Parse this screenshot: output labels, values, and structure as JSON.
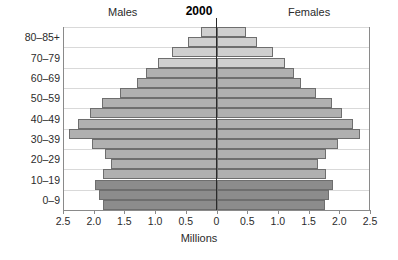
{
  "header": {
    "males_label": "Males",
    "females_label": "Females",
    "year_title": "2000"
  },
  "axis": {
    "x_title": "Millions",
    "x_tick_labels": [
      "2.5",
      "2.0",
      "1.5",
      "1.0",
      "0.5",
      "0",
      "0.5",
      "1.0",
      "1.5",
      "2.0",
      "2.5"
    ],
    "y_tick_labels": [
      "0–9",
      "10–19",
      "20–29",
      "30–39",
      "40–49",
      "50–59",
      "60–69",
      "70–79",
      "80–85+"
    ]
  },
  "colors": {
    "bar_light": "#cfcfcf",
    "bar_medium": "#b0b0b0",
    "bar_dark": "#8c8c8c",
    "bar_border": "#6e6e6e",
    "gridline": "#d9d9d9",
    "axis": "#8a8a8a",
    "center_axis": "#2a2a2a",
    "text": "#2b2b2b",
    "background": "#ffffff"
  },
  "chart_data": {
    "type": "bar",
    "subtype": "population-pyramid",
    "title": "2000",
    "xlabel": "Millions",
    "ylabel": "",
    "xlim": [
      -2.5,
      2.5
    ],
    "grid": true,
    "legend_position": "none",
    "left_series_name": "Males",
    "right_series_name": "Females",
    "categories": [
      "0–4",
      "5–9",
      "10–14",
      "15–19",
      "20–24",
      "25–29",
      "30–34",
      "35–39",
      "40–44",
      "45–49",
      "50–54",
      "55–59",
      "60–64",
      "65–69",
      "70–74",
      "75–79",
      "80–84",
      "85+"
    ],
    "series": [
      {
        "name": "Males",
        "values": [
          1.85,
          1.92,
          1.98,
          1.85,
          1.72,
          1.82,
          2.02,
          2.4,
          2.26,
          2.06,
          1.86,
          1.58,
          1.3,
          1.15,
          0.95,
          0.72,
          0.46,
          0.26
        ]
      },
      {
        "name": "Females",
        "values": [
          1.76,
          1.84,
          1.89,
          1.78,
          1.66,
          1.78,
          1.98,
          2.34,
          2.22,
          2.05,
          1.88,
          1.62,
          1.37,
          1.26,
          1.11,
          0.92,
          0.66,
          0.48
        ]
      }
    ],
    "shade_groups": [
      {
        "name": "young",
        "color": "#8c8c8c",
        "category_indices": [
          0,
          1,
          2
        ]
      },
      {
        "name": "adult",
        "color": "#b0b0b0",
        "category_indices": [
          3,
          4,
          5,
          6,
          7,
          8,
          9,
          10,
          11,
          12,
          13
        ]
      },
      {
        "name": "elderly",
        "color": "#cfcfcf",
        "category_indices": [
          14,
          15,
          16,
          17
        ]
      }
    ]
  }
}
